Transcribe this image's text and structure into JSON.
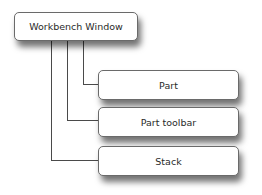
{
  "diagram": {
    "type": "hierarchy",
    "root": {
      "label": "Workbench Window"
    },
    "children": [
      {
        "label": "Part"
      },
      {
        "label": "Part toolbar"
      },
      {
        "label": "Stack"
      }
    ],
    "colors": {
      "border": "#6a6a6a",
      "line": "#4a4a4a",
      "text": "#2a2a2a",
      "background": "#ffffff"
    }
  }
}
